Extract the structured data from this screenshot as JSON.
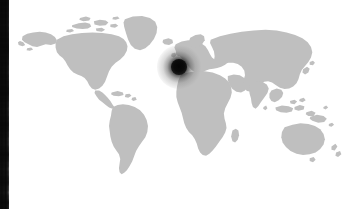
{
  "app": {
    "title": "World Map",
    "canvas_width": 355,
    "canvas_height": 209,
    "background_color": "#ffffff"
  },
  "map": {
    "name": "world-map",
    "projection": "equirectangular",
    "land_color": "#bfbfbf",
    "ocean_color": "#ffffff",
    "alt_text": "Gray silhouette world map",
    "regions": [
      "North America",
      "South America",
      "Greenland",
      "Europe",
      "Africa",
      "Asia",
      "Australia",
      "New Zealand",
      "Japan",
      "Indonesia",
      "Madagascar",
      "British Isles",
      "Arctic Archipelago"
    ]
  },
  "marker": {
    "name": "location-marker",
    "label": "",
    "color": "#0a0a0a",
    "halo_color": "rgba(20,20,20,0.9)",
    "x": 179,
    "y": 67,
    "region": "Western Europe",
    "style": "blurred-radial-dot"
  },
  "left_edge_strip": {
    "name": "adjacent-panel-sliver",
    "color": "#141414",
    "width": 9,
    "description": "Dark textured vertical band at left edge"
  }
}
